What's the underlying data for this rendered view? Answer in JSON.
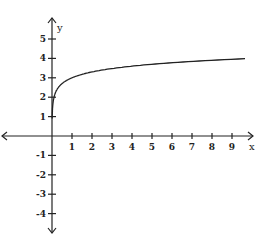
{
  "chart_data": {
    "type": "line",
    "title": "",
    "xlabel": "x",
    "ylabel": "y",
    "function": "y = 3 + log10(x)",
    "xlim": [
      -2.5,
      10
    ],
    "ylim": [
      -5,
      6
    ],
    "x_ticks": [
      1,
      2,
      3,
      4,
      5,
      6,
      7,
      8,
      9
    ],
    "y_ticks": [
      5,
      4,
      3,
      2,
      1,
      -1,
      -2,
      -3,
      -4
    ],
    "grid": false,
    "series": [
      {
        "name": "curve",
        "x": [
          0.01,
          0.05,
          0.1,
          0.25,
          0.5,
          1,
          2,
          3,
          4,
          5,
          6,
          7,
          8,
          9,
          9.6
        ],
        "y": [
          1,
          1.7,
          2,
          2.4,
          2.7,
          3,
          3.3,
          3.48,
          3.6,
          3.7,
          3.78,
          3.85,
          3.9,
          3.95,
          3.98
        ]
      }
    ]
  }
}
